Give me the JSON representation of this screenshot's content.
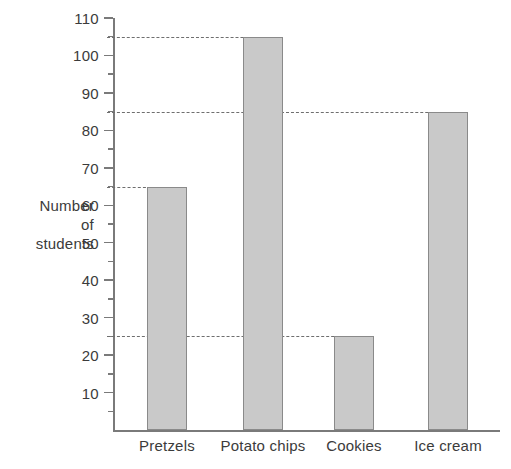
{
  "chart_data": {
    "type": "bar",
    "title": "",
    "xlabel": "",
    "ylabel": "Number of students",
    "ylabel_lines": [
      "Number",
      "of",
      "students"
    ],
    "categories": [
      "Pretzels",
      "Potato chips",
      "Cookies",
      "Ice cream"
    ],
    "values": [
      65,
      105,
      25,
      85
    ],
    "ylim": [
      0,
      110
    ],
    "ytick_labels": [
      "110",
      "100",
      "90",
      "80",
      "70",
      "60",
      "50",
      "40",
      "30",
      "20",
      "10"
    ],
    "ytick_values": [
      110,
      100,
      90,
      80,
      70,
      60,
      50,
      40,
      30,
      20,
      10
    ],
    "minor_tick_step": 5,
    "grid": false,
    "legend": null,
    "annotations": [
      {
        "name": "guide-105",
        "value": 105,
        "style": "dashed",
        "from": "y-axis",
        "to": "Potato chips"
      },
      {
        "name": "guide-85",
        "value": 85,
        "style": "dashed",
        "from": "y-axis",
        "to": "Ice cream"
      },
      {
        "name": "guide-65",
        "value": 65,
        "style": "dashed",
        "from": "y-axis",
        "to": "Pretzels"
      },
      {
        "name": "guide-25",
        "value": 25,
        "style": "dashed",
        "from": "y-axis",
        "to": "Cookies"
      }
    ],
    "colors": {
      "bar_fill": "#c9c9c9",
      "bar_stroke": "#8a8a8a",
      "axis": "#7a7a7a",
      "text": "#3b3b3b",
      "background": "#ffffff",
      "guide": "#6e6e6e"
    }
  }
}
